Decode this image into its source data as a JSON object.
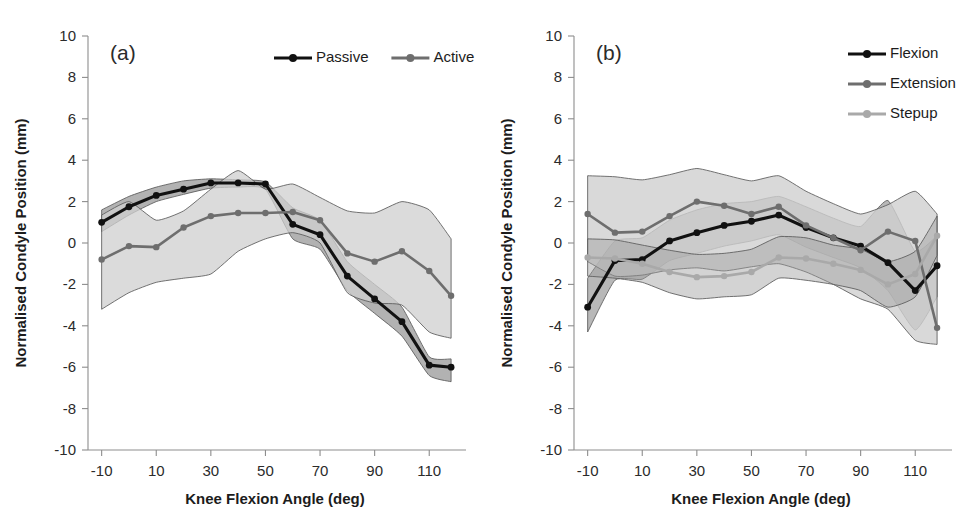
{
  "figure": {
    "width": 973,
    "height": 526,
    "background": "#ffffff"
  },
  "colors": {
    "black": "#111111",
    "mid_gray": "#6e6e6e",
    "light_gray": "#a9a9a9",
    "band_dark": "#888888",
    "band_mid": "#9e9e9e",
    "band_light": "#cfcfcf",
    "axis": "#8d8d8d",
    "text": "#1c1c1c"
  },
  "panels": [
    {
      "id": "panel-a",
      "label": "(a)",
      "axes": {
        "xlabel": "Knee Flexion Angle (deg)",
        "ylabel": "Normalised Condyle Position (mm)",
        "xlim": [
          -15,
          122
        ],
        "ylim": [
          -10,
          10
        ],
        "xticks": [
          -10,
          10,
          30,
          50,
          70,
          90,
          110
        ],
        "yticks": [
          10,
          8,
          6,
          4,
          2,
          0,
          -2,
          -4,
          -6,
          -8,
          -10
        ],
        "xtick_labels": [
          "-10",
          "10",
          "30",
          "50",
          "70",
          "90",
          "110"
        ],
        "ytick_labels": [
          "10",
          "8",
          "6",
          "4",
          "2",
          "0",
          "-2",
          "-4",
          "-6",
          "-8",
          "-10"
        ],
        "grid": false
      },
      "legend": {
        "position": "top-right",
        "orientation": "horizontal",
        "entries": [
          {
            "label": "Passive",
            "color": "#111111",
            "marker": "circle"
          },
          {
            "label": "Active",
            "color": "#6e6e6e",
            "marker": "circle"
          }
        ]
      },
      "chart_data": {
        "type": "line",
        "title": "(a)",
        "xlabel": "Knee Flexion Angle (deg)",
        "ylabel": "Normalised Condyle Position (mm)",
        "xlim": [
          -15,
          122
        ],
        "ylim": [
          -10,
          10
        ],
        "x": [
          -10,
          0,
          10,
          20,
          30,
          40,
          50,
          60,
          70,
          80,
          90,
          100,
          110,
          118
        ],
        "series": [
          {
            "name": "Passive",
            "color": "#111111",
            "values": [
              1.0,
              1.75,
              2.3,
              2.6,
              2.9,
              2.9,
              2.85,
              0.9,
              0.4,
              -1.6,
              -2.7,
              -3.8,
              -5.9,
              -6.0
            ],
            "band_upper": [
              1.6,
              2.25,
              2.7,
              3.0,
              3.1,
              3.05,
              2.95,
              1.7,
              1.1,
              -0.9,
              -2.0,
              -3.1,
              -5.5,
              -5.6
            ],
            "band_lower": [
              0.55,
              1.35,
              2.0,
              2.35,
              2.65,
              2.7,
              2.6,
              0.2,
              -0.3,
              -2.3,
              -3.4,
              -4.5,
              -6.4,
              -6.7
            ],
            "band_color": "#888888",
            "band_opacity": 0.65
          },
          {
            "name": "Active",
            "color": "#6e6e6e",
            "values": [
              -0.8,
              -0.15,
              -0.2,
              0.75,
              1.3,
              1.45,
              1.45,
              1.5,
              1.1,
              -0.5,
              -0.9,
              -0.4,
              -1.35,
              -2.55
            ],
            "band_upper": [
              1.35,
              2.0,
              1.1,
              1.55,
              2.6,
              3.5,
              2.6,
              2.85,
              2.2,
              1.55,
              1.45,
              2.0,
              1.6,
              0.2
            ],
            "band_lower": [
              -3.2,
              -2.4,
              -1.9,
              -1.7,
              -1.5,
              -0.4,
              0.2,
              0.5,
              0.0,
              -2.4,
              -2.9,
              -3.0,
              -4.3,
              -4.6
            ],
            "band_color": "#cfcfcf",
            "band_opacity": 0.75
          }
        ]
      }
    },
    {
      "id": "panel-b",
      "label": "(b)",
      "axes": {
        "xlabel": "Knee Flexion Angle (deg)",
        "ylabel": "Normalised Condyle Position (mm)",
        "xlim": [
          -15,
          122
        ],
        "ylim": [
          -10,
          10
        ],
        "xticks": [
          -10,
          10,
          30,
          50,
          70,
          90,
          110
        ],
        "yticks": [
          10,
          8,
          6,
          4,
          2,
          0,
          -2,
          -4,
          -6,
          -8,
          -10
        ],
        "xtick_labels": [
          "-10",
          "10",
          "30",
          "50",
          "70",
          "90",
          "110"
        ],
        "ytick_labels": [
          "10",
          "8",
          "6",
          "4",
          "2",
          "0",
          "-2",
          "-4",
          "-6",
          "-8",
          "-10"
        ],
        "grid": false
      },
      "legend": {
        "position": "top-right",
        "orientation": "vertical",
        "entries": [
          {
            "label": "Flexion",
            "color": "#111111",
            "marker": "circle"
          },
          {
            "label": "Extension",
            "color": "#6e6e6e",
            "marker": "circle"
          },
          {
            "label": "Stepup",
            "color": "#a9a9a9",
            "marker": "circle"
          }
        ]
      },
      "chart_data": {
        "type": "line",
        "title": "(b)",
        "xlabel": "Knee Flexion Angle (deg)",
        "ylabel": "Normalised Condyle Position (mm)",
        "xlim": [
          -15,
          122
        ],
        "ylim": [
          -10,
          10
        ],
        "x": [
          -10,
          0,
          10,
          20,
          30,
          40,
          50,
          60,
          70,
          80,
          90,
          100,
          110,
          118
        ],
        "series": [
          {
            "name": "Flexion",
            "color": "#111111",
            "values": [
              -3.1,
              -0.85,
              -0.8,
              0.1,
              0.5,
              0.85,
              1.05,
              1.35,
              0.75,
              0.25,
              -0.15,
              -0.95,
              -2.3,
              -1.1
            ],
            "band_upper": [
              -1.7,
              0.1,
              0.25,
              1.1,
              1.6,
              1.9,
              2.0,
              2.25,
              1.75,
              1.2,
              0.8,
              2.05,
              -0.4,
              0.35
            ],
            "band_lower": [
              -4.3,
              -1.8,
              -1.75,
              -0.85,
              -0.5,
              -0.15,
              0.1,
              0.4,
              -0.2,
              -0.7,
              -1.2,
              -2.3,
              -4.2,
              -2.6
            ],
            "band_color": "#888888",
            "band_opacity": 0.6
          },
          {
            "name": "Extension",
            "color": "#6e6e6e",
            "values": [
              1.4,
              0.5,
              0.55,
              1.3,
              2.0,
              1.8,
              1.4,
              1.75,
              0.85,
              0.25,
              -0.35,
              0.55,
              0.1,
              -4.1
            ],
            "band_upper": [
              3.25,
              3.2,
              3.05,
              3.3,
              3.6,
              3.3,
              3.0,
              3.25,
              2.5,
              1.9,
              1.4,
              1.85,
              2.5,
              1.4
            ],
            "band_lower": [
              -0.9,
              -1.6,
              -1.55,
              -1.3,
              -1.2,
              -1.35,
              -1.15,
              -1.0,
              -1.4,
              -2.0,
              -2.7,
              -3.2,
              -4.7,
              -4.9
            ],
            "band_color": "#cfcfcf",
            "band_opacity": 0.8
          },
          {
            "name": "Stepup",
            "color": "#a9a9a9",
            "values": [
              -0.7,
              -0.75,
              -1.0,
              -1.4,
              -1.65,
              -1.6,
              -1.4,
              -0.7,
              -0.75,
              -1.0,
              -1.3,
              -2.0,
              -1.5,
              0.35
            ],
            "band_upper": [
              0.2,
              0.15,
              -0.1,
              -0.35,
              -0.55,
              -0.5,
              -0.3,
              0.3,
              0.25,
              -0.1,
              -0.3,
              -0.9,
              -0.4,
              1.3
            ],
            "band_lower": [
              -1.6,
              -1.7,
              -1.9,
              -2.4,
              -2.7,
              -2.6,
              -2.5,
              -1.7,
              -1.8,
              -2.0,
              -2.3,
              -3.1,
              -2.6,
              -0.6
            ],
            "band_color": "#9e9e9e",
            "band_opacity": 0.45
          }
        ]
      }
    }
  ]
}
